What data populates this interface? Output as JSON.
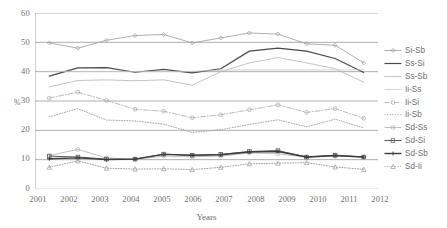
{
  "chart_data": {
    "type": "line",
    "title": "",
    "xlabel": "Years",
    "ylabel": "%",
    "categories": [
      "2001",
      "2002",
      "2003",
      "2004",
      "2005",
      "2006",
      "2007",
      "2008",
      "2009",
      "2010",
      "2011",
      "2012"
    ],
    "ylim": [
      0,
      60
    ],
    "yticks": [
      0,
      10,
      20,
      30,
      40,
      50,
      60
    ],
    "grid": true,
    "grid_axis": "y",
    "legend_position": "right",
    "series": [
      {
        "name": "Si-Sb",
        "color": "#9a9a9a",
        "style": "solid",
        "width": 0.8,
        "marker": "diamond",
        "values": [
          49.8,
          48.0,
          50.7,
          52.3,
          52.7,
          49.8,
          51.5,
          53.2,
          52.8,
          49.5,
          49.0,
          43.0
        ]
      },
      {
        "name": "Ss-Si",
        "color": "#4a4a4a",
        "style": "solid",
        "width": 1.2,
        "marker": "none",
        "values": [
          38.5,
          41.3,
          41.4,
          39.8,
          40.8,
          39.6,
          41.0,
          47.0,
          48.0,
          47.0,
          44.5,
          39.7
        ]
      },
      {
        "name": "Ss-Sb",
        "color": "#b4b4b4",
        "style": "solid",
        "width": 0.8,
        "marker": "none",
        "values": [
          34.8,
          37.0,
          37.2,
          36.9,
          37.2,
          35.4,
          40.0,
          43.0,
          44.8,
          43.0,
          41.0,
          36.4
        ]
      },
      {
        "name": "Ii-Ss",
        "color": "#c8c8c8",
        "style": "solid",
        "width": 0.8,
        "marker": "none",
        "values": [
          40.1,
          40.1,
          40.1,
          40.1,
          40.1,
          40.1,
          40.5,
          40.6,
          40.6,
          40.6,
          40.6,
          40.6
        ]
      },
      {
        "name": "Ii-Si",
        "color": "#a8a8a8",
        "style": "dashdot",
        "width": 0.8,
        "marker": "circle",
        "values": [
          31.0,
          33.0,
          30.2,
          27.2,
          26.5,
          24.3,
          25.3,
          27.0,
          28.7,
          26.1,
          27.4,
          24.1
        ]
      },
      {
        "name": "Ii-Sb",
        "color": "#9e9e9e",
        "style": "dotted",
        "width": 0.9,
        "marker": "none",
        "values": [
          24.6,
          27.4,
          23.5,
          23.2,
          22.1,
          19.3,
          20.2,
          22.0,
          23.6,
          21.2,
          23.8,
          20.8
        ]
      },
      {
        "name": "Sd-Ss",
        "color": "#b0b0b0",
        "style": "solid",
        "width": 0.8,
        "marker": "circle",
        "values": [
          11.4,
          13.5,
          10.6,
          10.1,
          11.2,
          11.0,
          11.2,
          12.3,
          12.0,
          10.8,
          11.2,
          10.9
        ]
      },
      {
        "name": "Sd-Si",
        "color": "#5a5a5a",
        "style": "solid",
        "width": 1.0,
        "marker": "square",
        "values": [
          11.2,
          10.9,
          10.2,
          10.2,
          11.9,
          11.5,
          11.8,
          12.8,
          13.1,
          10.9,
          11.5,
          10.9
        ]
      },
      {
        "name": "Sd-Sb",
        "color": "#3c3c3c",
        "style": "solid",
        "width": 1.4,
        "marker": "plus",
        "values": [
          10.3,
          10.6,
          10.0,
          10.2,
          11.8,
          11.5,
          11.7,
          12.6,
          12.8,
          10.9,
          11.4,
          10.9
        ]
      },
      {
        "name": "Sd-Ii",
        "color": "#9a9a9a",
        "style": "dotted",
        "width": 0.9,
        "marker": "triangle",
        "values": [
          7.4,
          9.6,
          7.1,
          6.8,
          6.9,
          6.6,
          7.4,
          8.6,
          8.8,
          9.0,
          7.5,
          6.7
        ]
      }
    ]
  },
  "axes": {
    "y_label": "%",
    "x_label": "Years",
    "y_tick_labels": [
      "60",
      "50",
      "40",
      "30",
      "20",
      "10",
      "0"
    ],
    "x_tick_labels": [
      "2001",
      "2002",
      "2003",
      "2004",
      "2005",
      "2006",
      "2007",
      "2008",
      "2009",
      "2010",
      "2011",
      "2012"
    ]
  },
  "legend": {
    "items": [
      {
        "label": "Si-Sb"
      },
      {
        "label": "Ss-Si"
      },
      {
        "label": "Ss-Sb"
      },
      {
        "label": "Ii-Ss"
      },
      {
        "label": "Ii-Si"
      },
      {
        "label": "Ii-Sb"
      },
      {
        "label": "Sd-Ss"
      },
      {
        "label": "Sd-Si"
      },
      {
        "label": "Sd-Sb"
      },
      {
        "label": "Sd-Ii"
      }
    ]
  },
  "colors": {
    "axis": "#8c8c8c",
    "text": "#6e6e6e",
    "background": "#ffffff"
  }
}
